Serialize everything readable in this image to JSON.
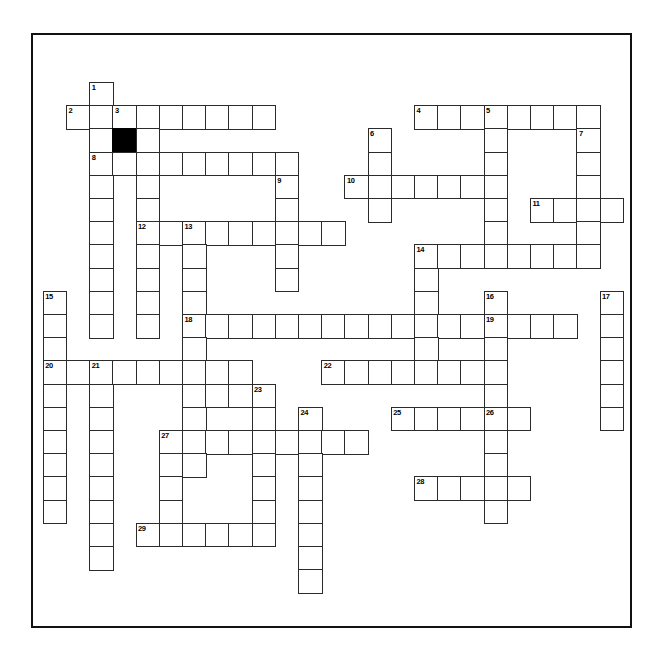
{
  "page": {
    "background_color": "#ffffff",
    "frame_color": "#111111",
    "cell_border_color": "#2b2b2b",
    "block_color": "#000000"
  },
  "grid": {
    "cell_size": 23.2,
    "origin_x": 42.8,
    "origin_y": 82.0,
    "columns": 25,
    "rows": 24,
    "numbering_style": "standard-crossword",
    "highest_number": 29
  },
  "clue_numbers": [
    {
      "n": 1,
      "col": 2,
      "row": 0
    },
    {
      "n": 2,
      "col": 1,
      "row": 1
    },
    {
      "n": 3,
      "col": 3,
      "row": 1
    },
    {
      "n": 4,
      "col": 16,
      "row": 1
    },
    {
      "n": 5,
      "col": 19,
      "row": 1
    },
    {
      "n": 6,
      "col": 14,
      "row": 2
    },
    {
      "n": 7,
      "col": 23,
      "row": 2
    },
    {
      "n": 8,
      "col": 2,
      "row": 3
    },
    {
      "n": 9,
      "col": 10,
      "row": 4
    },
    {
      "n": 10,
      "col": 13,
      "row": 4
    },
    {
      "n": 11,
      "col": 21,
      "row": 5
    },
    {
      "n": 12,
      "col": 4,
      "row": 6
    },
    {
      "n": 13,
      "col": 6,
      "row": 6
    },
    {
      "n": 14,
      "col": 16,
      "row": 7
    },
    {
      "n": 15,
      "col": 0,
      "row": 9
    },
    {
      "n": 16,
      "col": 19,
      "row": 9
    },
    {
      "n": 17,
      "col": 24,
      "row": 9
    },
    {
      "n": 18,
      "col": 6,
      "row": 10
    },
    {
      "n": 19,
      "col": 19,
      "row": 10
    },
    {
      "n": 20,
      "col": 0,
      "row": 12
    },
    {
      "n": 21,
      "col": 2,
      "row": 12
    },
    {
      "n": 22,
      "col": 12,
      "row": 12
    },
    {
      "n": 23,
      "col": 9,
      "row": 13
    },
    {
      "n": 24,
      "col": 11,
      "row": 14
    },
    {
      "n": 25,
      "col": 15,
      "row": 14
    },
    {
      "n": 26,
      "col": 19,
      "row": 14
    },
    {
      "n": 27,
      "col": 5,
      "row": 15
    },
    {
      "n": 28,
      "col": 16,
      "row": 17
    },
    {
      "n": 29,
      "col": 4,
      "row": 19
    }
  ],
  "blocks": [
    {
      "col": 3,
      "row": 2
    }
  ],
  "cells": [
    {
      "col": 2,
      "row": 0
    },
    {
      "col": 1,
      "row": 1
    },
    {
      "col": 2,
      "row": 1
    },
    {
      "col": 3,
      "row": 1
    },
    {
      "col": 4,
      "row": 1
    },
    {
      "col": 5,
      "row": 1
    },
    {
      "col": 6,
      "row": 1
    },
    {
      "col": 7,
      "row": 1
    },
    {
      "col": 8,
      "row": 1
    },
    {
      "col": 9,
      "row": 1
    },
    {
      "col": 16,
      "row": 1
    },
    {
      "col": 17,
      "row": 1
    },
    {
      "col": 18,
      "row": 1
    },
    {
      "col": 19,
      "row": 1
    },
    {
      "col": 20,
      "row": 1
    },
    {
      "col": 21,
      "row": 1
    },
    {
      "col": 22,
      "row": 1
    },
    {
      "col": 23,
      "row": 1
    },
    {
      "col": 2,
      "row": 2
    },
    {
      "col": 3,
      "row": 2
    },
    {
      "col": 4,
      "row": 2
    },
    {
      "col": 14,
      "row": 2
    },
    {
      "col": 19,
      "row": 2
    },
    {
      "col": 23,
      "row": 2
    },
    {
      "col": 2,
      "row": 3
    },
    {
      "col": 3,
      "row": 3
    },
    {
      "col": 4,
      "row": 3
    },
    {
      "col": 5,
      "row": 3
    },
    {
      "col": 6,
      "row": 3
    },
    {
      "col": 7,
      "row": 3
    },
    {
      "col": 8,
      "row": 3
    },
    {
      "col": 9,
      "row": 3
    },
    {
      "col": 10,
      "row": 3
    },
    {
      "col": 14,
      "row": 3
    },
    {
      "col": 19,
      "row": 3
    },
    {
      "col": 23,
      "row": 3
    },
    {
      "col": 2,
      "row": 4
    },
    {
      "col": 4,
      "row": 4
    },
    {
      "col": 10,
      "row": 4
    },
    {
      "col": 13,
      "row": 4
    },
    {
      "col": 14,
      "row": 4
    },
    {
      "col": 15,
      "row": 4
    },
    {
      "col": 16,
      "row": 4
    },
    {
      "col": 17,
      "row": 4
    },
    {
      "col": 18,
      "row": 4
    },
    {
      "col": 19,
      "row": 4
    },
    {
      "col": 23,
      "row": 4
    },
    {
      "col": 2,
      "row": 5
    },
    {
      "col": 4,
      "row": 5
    },
    {
      "col": 10,
      "row": 5
    },
    {
      "col": 14,
      "row": 5
    },
    {
      "col": 19,
      "row": 5
    },
    {
      "col": 21,
      "row": 5
    },
    {
      "col": 22,
      "row": 5
    },
    {
      "col": 23,
      "row": 5
    },
    {
      "col": 24,
      "row": 5
    },
    {
      "col": 2,
      "row": 6
    },
    {
      "col": 4,
      "row": 6
    },
    {
      "col": 5,
      "row": 6
    },
    {
      "col": 6,
      "row": 6
    },
    {
      "col": 7,
      "row": 6
    },
    {
      "col": 8,
      "row": 6
    },
    {
      "col": 9,
      "row": 6
    },
    {
      "col": 10,
      "row": 6
    },
    {
      "col": 11,
      "row": 6
    },
    {
      "col": 12,
      "row": 6
    },
    {
      "col": 19,
      "row": 6
    },
    {
      "col": 23,
      "row": 6
    },
    {
      "col": 2,
      "row": 7
    },
    {
      "col": 4,
      "row": 7
    },
    {
      "col": 6,
      "row": 7
    },
    {
      "col": 10,
      "row": 7
    },
    {
      "col": 16,
      "row": 7
    },
    {
      "col": 17,
      "row": 7
    },
    {
      "col": 18,
      "row": 7
    },
    {
      "col": 19,
      "row": 7
    },
    {
      "col": 20,
      "row": 7
    },
    {
      "col": 21,
      "row": 7
    },
    {
      "col": 22,
      "row": 7
    },
    {
      "col": 23,
      "row": 7
    },
    {
      "col": 2,
      "row": 8
    },
    {
      "col": 4,
      "row": 8
    },
    {
      "col": 6,
      "row": 8
    },
    {
      "col": 10,
      "row": 8
    },
    {
      "col": 16,
      "row": 8
    },
    {
      "col": 0,
      "row": 9
    },
    {
      "col": 2,
      "row": 9
    },
    {
      "col": 4,
      "row": 9
    },
    {
      "col": 6,
      "row": 9
    },
    {
      "col": 16,
      "row": 9
    },
    {
      "col": 19,
      "row": 9
    },
    {
      "col": 24,
      "row": 9
    },
    {
      "col": 0,
      "row": 10
    },
    {
      "col": 2,
      "row": 10
    },
    {
      "col": 4,
      "row": 10
    },
    {
      "col": 6,
      "row": 10
    },
    {
      "col": 7,
      "row": 10
    },
    {
      "col": 8,
      "row": 10
    },
    {
      "col": 9,
      "row": 10
    },
    {
      "col": 10,
      "row": 10
    },
    {
      "col": 11,
      "row": 10
    },
    {
      "col": 12,
      "row": 10
    },
    {
      "col": 13,
      "row": 10
    },
    {
      "col": 14,
      "row": 10
    },
    {
      "col": 15,
      "row": 10
    },
    {
      "col": 16,
      "row": 10
    },
    {
      "col": 17,
      "row": 10
    },
    {
      "col": 18,
      "row": 10
    },
    {
      "col": 19,
      "row": 10
    },
    {
      "col": 20,
      "row": 10
    },
    {
      "col": 21,
      "row": 10
    },
    {
      "col": 22,
      "row": 10
    },
    {
      "col": 24,
      "row": 10
    },
    {
      "col": 0,
      "row": 11
    },
    {
      "col": 6,
      "row": 11
    },
    {
      "col": 16,
      "row": 11
    },
    {
      "col": 19,
      "row": 11
    },
    {
      "col": 24,
      "row": 11
    },
    {
      "col": 0,
      "row": 12
    },
    {
      "col": 1,
      "row": 12
    },
    {
      "col": 2,
      "row": 12
    },
    {
      "col": 3,
      "row": 12
    },
    {
      "col": 4,
      "row": 12
    },
    {
      "col": 5,
      "row": 12
    },
    {
      "col": 6,
      "row": 12
    },
    {
      "col": 7,
      "row": 12
    },
    {
      "col": 8,
      "row": 12
    },
    {
      "col": 12,
      "row": 12
    },
    {
      "col": 13,
      "row": 12
    },
    {
      "col": 14,
      "row": 12
    },
    {
      "col": 15,
      "row": 12
    },
    {
      "col": 16,
      "row": 12
    },
    {
      "col": 17,
      "row": 12
    },
    {
      "col": 18,
      "row": 12
    },
    {
      "col": 19,
      "row": 12
    },
    {
      "col": 24,
      "row": 12
    },
    {
      "col": 0,
      "row": 13
    },
    {
      "col": 2,
      "row": 13
    },
    {
      "col": 6,
      "row": 13
    },
    {
      "col": 7,
      "row": 13
    },
    {
      "col": 8,
      "row": 13
    },
    {
      "col": 9,
      "row": 13
    },
    {
      "col": 19,
      "row": 13
    },
    {
      "col": 24,
      "row": 13
    },
    {
      "col": 0,
      "row": 14
    },
    {
      "col": 2,
      "row": 14
    },
    {
      "col": 6,
      "row": 14
    },
    {
      "col": 9,
      "row": 14
    },
    {
      "col": 11,
      "row": 14
    },
    {
      "col": 15,
      "row": 14
    },
    {
      "col": 16,
      "row": 14
    },
    {
      "col": 17,
      "row": 14
    },
    {
      "col": 18,
      "row": 14
    },
    {
      "col": 19,
      "row": 14
    },
    {
      "col": 20,
      "row": 14
    },
    {
      "col": 24,
      "row": 14
    },
    {
      "col": 0,
      "row": 15
    },
    {
      "col": 2,
      "row": 15
    },
    {
      "col": 5,
      "row": 15
    },
    {
      "col": 6,
      "row": 15
    },
    {
      "col": 7,
      "row": 15
    },
    {
      "col": 8,
      "row": 15
    },
    {
      "col": 9,
      "row": 15
    },
    {
      "col": 10,
      "row": 15
    },
    {
      "col": 11,
      "row": 15
    },
    {
      "col": 12,
      "row": 15
    },
    {
      "col": 13,
      "row": 15
    },
    {
      "col": 19,
      "row": 15
    },
    {
      "col": 0,
      "row": 16
    },
    {
      "col": 2,
      "row": 16
    },
    {
      "col": 5,
      "row": 16
    },
    {
      "col": 6,
      "row": 16
    },
    {
      "col": 9,
      "row": 16
    },
    {
      "col": 11,
      "row": 16
    },
    {
      "col": 19,
      "row": 16
    },
    {
      "col": 0,
      "row": 17
    },
    {
      "col": 2,
      "row": 17
    },
    {
      "col": 5,
      "row": 17
    },
    {
      "col": 9,
      "row": 17
    },
    {
      "col": 11,
      "row": 17
    },
    {
      "col": 16,
      "row": 17
    },
    {
      "col": 17,
      "row": 17
    },
    {
      "col": 18,
      "row": 17
    },
    {
      "col": 19,
      "row": 17
    },
    {
      "col": 20,
      "row": 17
    },
    {
      "col": 0,
      "row": 18
    },
    {
      "col": 2,
      "row": 18
    },
    {
      "col": 5,
      "row": 18
    },
    {
      "col": 9,
      "row": 18
    },
    {
      "col": 11,
      "row": 18
    },
    {
      "col": 19,
      "row": 18
    },
    {
      "col": 2,
      "row": 19
    },
    {
      "col": 4,
      "row": 19
    },
    {
      "col": 5,
      "row": 19
    },
    {
      "col": 6,
      "row": 19
    },
    {
      "col": 7,
      "row": 19
    },
    {
      "col": 8,
      "row": 19
    },
    {
      "col": 9,
      "row": 19
    },
    {
      "col": 11,
      "row": 19
    },
    {
      "col": 2,
      "row": 20
    },
    {
      "col": 11,
      "row": 20
    },
    {
      "col": 11,
      "row": 21
    }
  ]
}
